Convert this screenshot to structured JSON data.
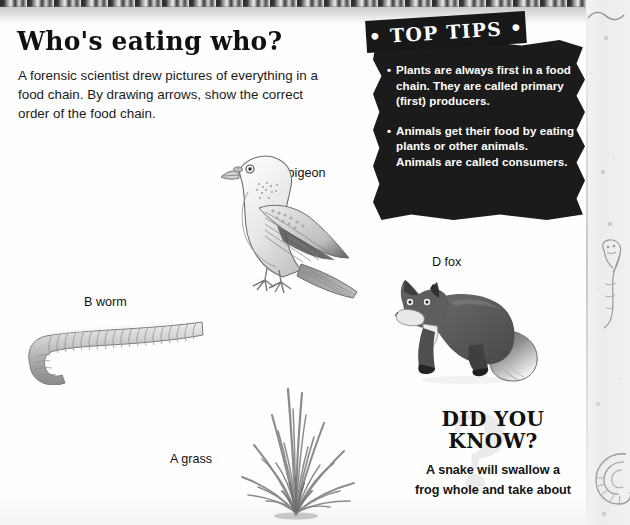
{
  "page": {
    "title": "Who's eating who?",
    "intro": "A forensic scientist drew pictures of everything in a food chain. By drawing arrows, show the correct order of the food chain.",
    "background_color": "#fefefe",
    "ink_color": "#111111"
  },
  "top_tips": {
    "banner_label": "• TOP TIPS •",
    "panel_color": "#1b1b1b",
    "text_color": "#ffffff",
    "bullet_glyph": "•",
    "items": [
      "Plants are always first in a food chain. They are called primary (first) producers.",
      "Animals get their food by eating plants or other animals. Animals are called consumers."
    ]
  },
  "did_you_know": {
    "title_line_1": "DID YOU",
    "title_line_2": "KNOW?",
    "watermark": "?",
    "body_line_1": "A snake will swallow a",
    "body_line_2": "frog whole and take about"
  },
  "specimens": [
    {
      "id": "grass",
      "label": "A grass",
      "icon": "grass-tuft-illustration"
    },
    {
      "id": "worm",
      "label": "B worm",
      "icon": "earthworm-illustration"
    },
    {
      "id": "pigeon",
      "label": "C pigeon",
      "icon": "pigeon-illustration"
    },
    {
      "id": "fox",
      "label": "D fox",
      "icon": "fox-illustration"
    }
  ],
  "margin_doodles": [
    {
      "id": "worm-doodle",
      "icon": "worm-doodle-icon"
    },
    {
      "id": "snail-doodle",
      "icon": "snail-shell-doodle-icon"
    },
    {
      "id": "squiggle-doodle",
      "icon": "squiggle-doodle-icon"
    }
  ]
}
